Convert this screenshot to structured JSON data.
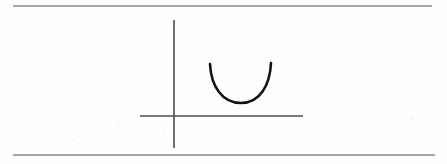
{
  "figure": {
    "kind": "scanned-math-figure",
    "description": "Hand-drawn parabola opening upward plotted on a coordinate axis, enclosed between two horizontal rules",
    "background_color": "#fefefe",
    "ink_color": "#1a1a1a",
    "rule_color": "#888888",
    "axis_color": "#555555",
    "rules": [
      {
        "name": "top-rule",
        "x1": 13,
        "y1": 6,
        "x2": 432,
        "y2": 6,
        "thickness": 1.4,
        "color": "#8a8a8a"
      },
      {
        "name": "bottom-rule",
        "x1": 13,
        "y1": 155,
        "x2": 435,
        "y2": 155,
        "thickness": 1.4,
        "color": "#8a8a8a"
      }
    ],
    "axes": {
      "y_axis": {
        "label": "vertical-axis",
        "x1": 174,
        "y1": 20,
        "x2": 174,
        "y2": 148,
        "thickness": 1.6,
        "color": "#4d4d4d"
      },
      "x_axis": {
        "label": "horizontal-axis",
        "x1": 140,
        "y1": 116,
        "x2": 303,
        "y2": 116,
        "thickness": 1.6,
        "color": "#4d4d4d"
      },
      "origin": {
        "x": 174,
        "y": 116
      }
    },
    "curve": {
      "label": "parabola-curve",
      "shape": "U",
      "opens": "upward",
      "color": "#141414",
      "thickness": 2.6,
      "left_endpoint": {
        "x": 210,
        "y": 64
      },
      "right_endpoint": {
        "x": 271,
        "y": 63
      },
      "vertex": {
        "x": 241,
        "y": 103
      },
      "path": "M 210 64 C 211 86, 222 103, 241 103 C 260 103, 270 85, 271 63"
    },
    "speckles": [
      {
        "x": 52,
        "y": 66
      },
      {
        "x": 96,
        "y": 47
      },
      {
        "x": 118,
        "y": 122
      },
      {
        "x": 158,
        "y": 73
      },
      {
        "x": 163,
        "y": 130
      },
      {
        "x": 201,
        "y": 40
      },
      {
        "x": 249,
        "y": 131
      },
      {
        "x": 303,
        "y": 59
      },
      {
        "x": 344,
        "y": 95
      },
      {
        "x": 388,
        "y": 41
      },
      {
        "x": 411,
        "y": 118
      },
      {
        "x": 72,
        "y": 139
      }
    ]
  }
}
